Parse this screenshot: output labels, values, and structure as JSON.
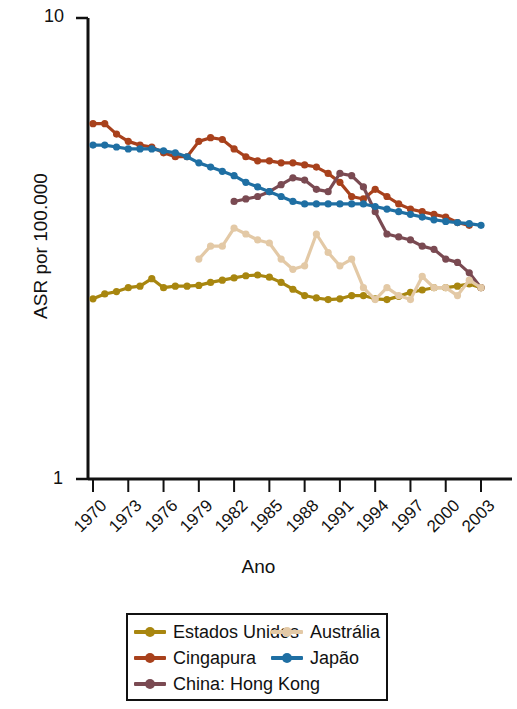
{
  "chart_data": {
    "type": "line",
    "title": "",
    "xlabel": "Ano",
    "ylabel": "ASR por 100.000",
    "yscale": "log",
    "ylim": [
      1,
      10
    ],
    "ytick_labels": [
      "10",
      "1"
    ],
    "xlim": [
      1970,
      2003
    ],
    "xtick_labels": [
      "1970",
      "1973",
      "1976",
      "1979",
      "1982",
      "1985",
      "1988",
      "1991",
      "1994",
      "1997",
      "2000",
      "2003"
    ],
    "grid": false,
    "legend_position": "below-plot",
    "x": [
      1970,
      1971,
      1972,
      1973,
      1974,
      1975,
      1976,
      1977,
      1978,
      1979,
      1980,
      1981,
      1982,
      1983,
      1984,
      1985,
      1986,
      1987,
      1988,
      1989,
      1990,
      1991,
      1992,
      1993,
      1994,
      1995,
      1996,
      1997,
      1998,
      1999,
      2000,
      2001,
      2002,
      2003
    ],
    "series": [
      {
        "name": "Estados Unidos",
        "color": "#a8860f",
        "x": [
          1970,
          1971,
          1972,
          1973,
          1974,
          1975,
          1976,
          1977,
          1978,
          1979,
          1980,
          1981,
          1982,
          1983,
          1984,
          1985,
          1986,
          1987,
          1988,
          1989,
          1990,
          1991,
          1992,
          1993,
          1994,
          1995,
          1996,
          1997,
          1998,
          1999,
          2000,
          2001,
          2002,
          2003
        ],
        "values": [
          2.46,
          2.52,
          2.55,
          2.6,
          2.62,
          2.72,
          2.6,
          2.62,
          2.62,
          2.63,
          2.67,
          2.7,
          2.73,
          2.76,
          2.77,
          2.74,
          2.67,
          2.58,
          2.5,
          2.47,
          2.45,
          2.46,
          2.5,
          2.5,
          2.46,
          2.45,
          2.49,
          2.54,
          2.57,
          2.6,
          2.6,
          2.62,
          2.65,
          2.6
        ]
      },
      {
        "name": "Cingapura",
        "color": "#a8411c",
        "x": [
          1970,
          1971,
          1972,
          1973,
          1974,
          1975,
          1976,
          1977,
          1978,
          1979,
          1980,
          1981,
          1982,
          1983,
          1984,
          1985,
          1986,
          1987,
          1988,
          1989,
          1990,
          1991,
          1992,
          1993,
          1994,
          1995,
          1996,
          1997,
          1998,
          1999,
          2000,
          2001,
          2002
        ],
        "values": [
          5.9,
          5.9,
          5.6,
          5.4,
          5.3,
          5.25,
          5.1,
          5.0,
          5.0,
          5.4,
          5.5,
          5.45,
          5.2,
          5.0,
          4.9,
          4.9,
          4.85,
          4.85,
          4.8,
          4.75,
          4.6,
          4.4,
          4.1,
          4.05,
          4.25,
          4.1,
          3.95,
          3.85,
          3.8,
          3.75,
          3.7,
          3.6,
          3.55
        ]
      },
      {
        "name": "China: Hong Kong",
        "color": "#7a4a52",
        "x": [
          1982,
          1983,
          1984,
          1985,
          1986,
          1987,
          1988,
          1989,
          1990,
          1991,
          1992,
          1993,
          1994,
          1995,
          1996,
          1997,
          1998,
          1999,
          2000,
          2001,
          2002,
          2003
        ],
        "values": [
          4.0,
          4.05,
          4.1,
          4.2,
          4.35,
          4.5,
          4.45,
          4.25,
          4.2,
          4.6,
          4.55,
          4.3,
          3.8,
          3.4,
          3.35,
          3.3,
          3.2,
          3.15,
          3.0,
          2.95,
          2.8,
          2.6
        ]
      },
      {
        "name": "Austrália",
        "color": "#e3c9a6",
        "x": [
          1979,
          1980,
          1981,
          1982,
          1983,
          1984,
          1985,
          1986,
          1987,
          1988,
          1989,
          1990,
          1991,
          1992,
          1993,
          1994,
          1995,
          1996,
          1997,
          1998,
          1999,
          2000,
          2001,
          2002,
          2003
        ],
        "values": [
          3.0,
          3.2,
          3.2,
          3.5,
          3.4,
          3.3,
          3.25,
          3.0,
          2.85,
          2.9,
          3.4,
          3.1,
          2.9,
          3.0,
          2.6,
          2.45,
          2.6,
          2.5,
          2.45,
          2.75,
          2.6,
          2.6,
          2.5,
          2.7,
          2.6
        ]
      },
      {
        "name": "Japão",
        "color": "#1f6fa3",
        "x": [
          1970,
          1971,
          1972,
          1973,
          1974,
          1975,
          1976,
          1977,
          1978,
          1979,
          1980,
          1981,
          1982,
          1983,
          1984,
          1985,
          1986,
          1987,
          1988,
          1989,
          1990,
          1991,
          1992,
          1993,
          1994,
          1995,
          1996,
          1997,
          1998,
          1999,
          2000,
          2001,
          2002,
          2003
        ],
        "values": [
          5.3,
          5.3,
          5.25,
          5.2,
          5.2,
          5.2,
          5.15,
          5.1,
          5.0,
          4.85,
          4.75,
          4.65,
          4.55,
          4.4,
          4.3,
          4.2,
          4.1,
          4.0,
          3.95,
          3.95,
          3.95,
          3.95,
          3.95,
          3.95,
          3.9,
          3.85,
          3.8,
          3.75,
          3.7,
          3.65,
          3.62,
          3.6,
          3.58,
          3.55
        ]
      }
    ]
  },
  "axes": {
    "y_top_label": "10",
    "y_bottom_label": "1",
    "y_axis_title": "ASR por 100.000",
    "x_axis_title": "Ano"
  },
  "legend": {
    "left_column": [
      {
        "label": "Estados Unidos",
        "color": "#a8860f"
      },
      {
        "label": "Cingapura",
        "color": "#a8411c"
      },
      {
        "label": "China: Hong Kong",
        "color": "#7a4a52"
      }
    ],
    "right_column": [
      {
        "label": "Austrália",
        "color": "#e3c9a6"
      },
      {
        "label": "Japão",
        "color": "#1f6fa3"
      }
    ]
  }
}
